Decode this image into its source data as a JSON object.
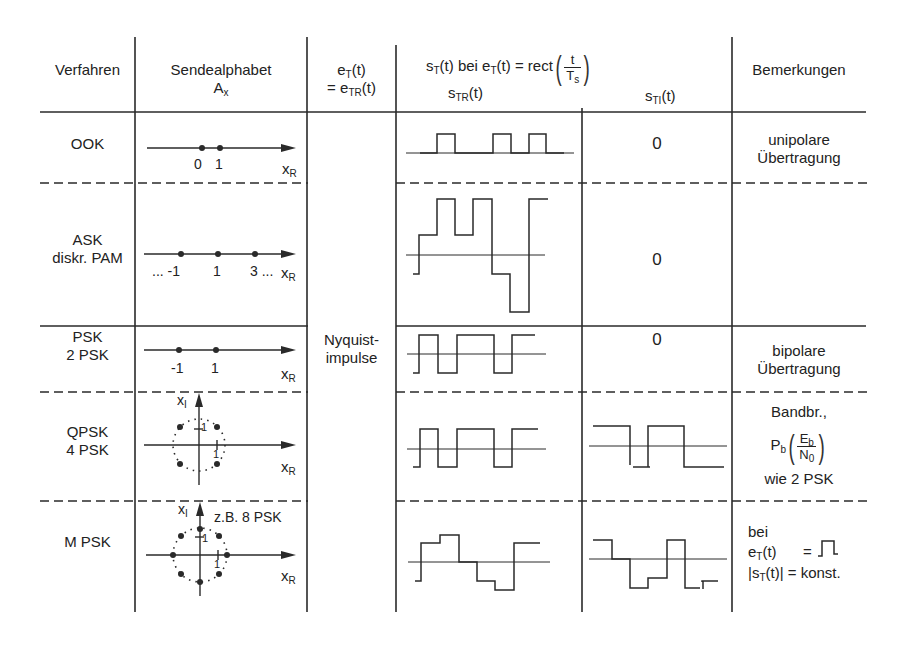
{
  "header": {
    "col_verfahren": "Verfahren",
    "col_sendealphabet_line1": "Sendealphabet",
    "col_sendealphabet_sym": "A",
    "col_sendealphabet_sub": "x",
    "col_et_line1_base": "e",
    "col_et_line1_sub": "T",
    "col_et_line1_arg": "(t)",
    "col_et_line2_pre": "= e",
    "col_et_line2_sub": "TR",
    "col_et_line2_arg": "(t)",
    "col_st_pre": "s",
    "col_st_sub": "T",
    "col_st_mid": "(t) bei e",
    "col_st_sub2": "T",
    "col_st_post": "(t) = rect",
    "col_st_frac_num": "t",
    "col_st_frac_den_base": "T",
    "col_st_frac_den_sub": "s",
    "col_str_base": "s",
    "col_str_sub": "TR",
    "col_str_arg": "(t)",
    "col_sti_base": "s",
    "col_sti_sub": "TI",
    "col_sti_arg": "(t)",
    "col_bemerkungen": "Bemerkungen"
  },
  "rows": [
    {
      "verfahren": [
        "OOK"
      ],
      "alphabet_labels": [
        "0",
        "1"
      ],
      "axis_label_base": "x",
      "axis_label_sub": "R",
      "s_ti": "0",
      "remarks": [
        "unipolare",
        "Übertragung"
      ]
    },
    {
      "verfahren": [
        "ASK",
        "diskr. PAM"
      ],
      "alphabet_labels": [
        "... -1",
        "1",
        "3 ..."
      ],
      "axis_label_base": "x",
      "axis_label_sub": "R",
      "s_ti": "0",
      "remarks": []
    },
    {
      "verfahren": [
        "PSK",
        "2 PSK"
      ],
      "alphabet_labels": [
        "-1",
        "1"
      ],
      "axis_label_base": "x",
      "axis_label_sub": "R",
      "s_ti": "0",
      "remarks": [
        "bipolare",
        "Übertragung"
      ]
    },
    {
      "verfahren": [
        "QPSK",
        "4 PSK"
      ],
      "alphabet_labels": [
        "1",
        "1"
      ],
      "axis_label_base": "x",
      "axis_label_sub": "R",
      "axis_i_base": "x",
      "axis_i_sub": "I",
      "remarks": [
        "Bandbr.,",
        "wie 2 PSK"
      ],
      "remark_formula": {
        "base": "P",
        "sub": "b",
        "num_base": "E",
        "num_sub": "b",
        "den_base": "N",
        "den_sub": "0"
      }
    },
    {
      "verfahren": [
        "M PSK"
      ],
      "alphabet_labels": [
        "1",
        "1"
      ],
      "alphabet_note": "z.B. 8 PSK",
      "axis_label_base": "x",
      "axis_label_sub": "R",
      "axis_i_base": "x",
      "axis_i_sub": "I",
      "remarks": [
        "bei"
      ],
      "remark_et_base": "e",
      "remark_et_sub": "T",
      "remark_et_arg": "(t)",
      "remark_eq": "=",
      "remark_abs_pre": "|s",
      "remark_abs_sub": "T",
      "remark_abs_post": "(t)| = konst."
    }
  ],
  "merged_cell": {
    "line1": "Nyquist-",
    "line2": "impulse"
  }
}
